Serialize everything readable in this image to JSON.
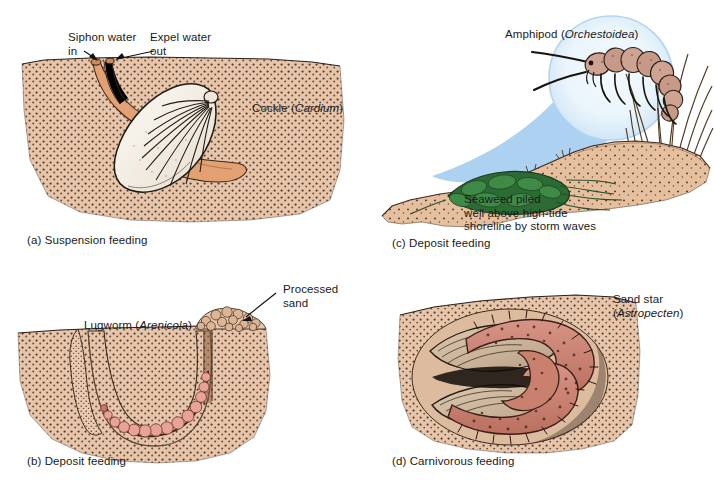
{
  "figure": {
    "background_color": "#ffffff"
  },
  "palette": {
    "sand": "#e7c5ab",
    "sand_dark": "#d8b193",
    "sand_dune": "#e3bb9c",
    "stipple": "#4a3424",
    "ink": "#1a1a1a",
    "shell": "#f4efe6",
    "siphon_orange": "#e09a67",
    "worm_pink": "#e8a396",
    "seaweed_green": "#2d6b35",
    "seaweed_green_dark": "#1d4a24",
    "magnifier_blue": "#a9cff0",
    "magnifier_inner": "#f0f8fd",
    "amphipod_body": "#cfa392",
    "sandstar_rose": "#c9806f",
    "grass_brown": "#6b4a2c"
  },
  "panels": [
    {
      "id": "a",
      "caption": "(a) Suspension feeding",
      "organism": "Cockle",
      "genus": "Cardium",
      "organism_label_prefix": "Cockle (",
      "organism_label_suffix": ")",
      "annotations": [
        {
          "name": "siphon-water-in",
          "line1": "Siphon water",
          "line2": "in"
        },
        {
          "name": "expel-water-out",
          "line1": "Expel water",
          "line2": "out"
        }
      ]
    },
    {
      "id": "b",
      "caption": "(b) Deposit feeding",
      "organism": "Lugworm",
      "genus": "Arenicola",
      "organism_label_prefix": "Lugworm (",
      "organism_label_suffix": ")",
      "annotations": [
        {
          "name": "processed-sand",
          "line1": "Processed",
          "line2": "sand"
        }
      ]
    },
    {
      "id": "c",
      "caption": "(c) Deposit feeding",
      "organism": "Amphipod",
      "genus": "Orchestoidea",
      "organism_label_prefix": "Amphipod (",
      "organism_label_suffix": ")",
      "annotations": [
        {
          "name": "seaweed-note",
          "line1": "Seaweed piled",
          "line2": "well above high-tide",
          "line3": "shoreline by storm waves"
        }
      ]
    },
    {
      "id": "d",
      "caption": "(d) Carnivorous feeding",
      "organism": "Sand star",
      "genus": "Astropecten",
      "organism_label_line1": "Sand star",
      "organism_label_line2_prefix": "(",
      "organism_label_line2_suffix": ")"
    }
  ]
}
